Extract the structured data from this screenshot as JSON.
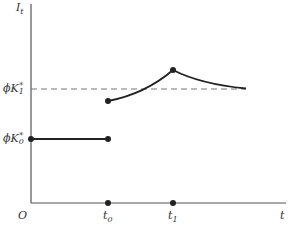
{
  "diagram": {
    "y_axis_label": {
      "base": "I",
      "sub": "t"
    },
    "x_axis_label": "t",
    "origin_label": "O",
    "x_ticks": [
      {
        "base": "t",
        "sub": "0"
      },
      {
        "base": "t",
        "sub": "1"
      }
    ],
    "y_levels": [
      {
        "prefix": "ϕK",
        "sup": "*",
        "sub": "1",
        "style": "dashed"
      },
      {
        "prefix": "ϕK",
        "sup": "*",
        "sub": "0",
        "style": "solid"
      }
    ],
    "segments": [
      {
        "name": "initial-level",
        "from": "0",
        "to": "t0",
        "value": "ϕK₀*"
      },
      {
        "name": "rising-curve",
        "from": "t0",
        "to": "t1"
      },
      {
        "name": "decaying-curve",
        "from": "t1",
        "to": "approaches ϕK₁*"
      }
    ],
    "colors": {
      "line": "#222222",
      "axis": "#555555",
      "dashed": "#777777"
    }
  }
}
